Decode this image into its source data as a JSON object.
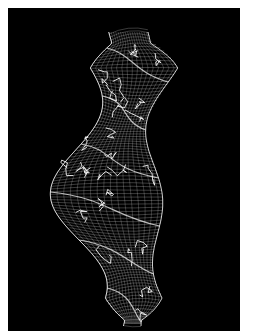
{
  "figure": {
    "background_color": "#000000",
    "border_color": "#ffffff",
    "mesh_color": "#d8d8d8",
    "highlight_color": "#ffffff"
  }
}
